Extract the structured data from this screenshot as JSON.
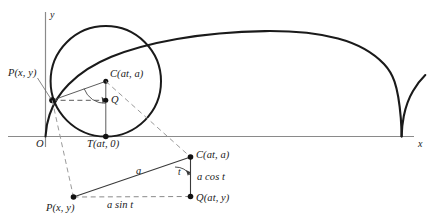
{
  "figure": {
    "axes": {
      "x_label": "x",
      "y_label": "y",
      "origin_label": "O"
    },
    "upper_diagram": {
      "point_P_label": "P(x, y)",
      "point_C_label": "C(at, a)",
      "point_Q_label": "Q",
      "point_T_label": "T(at, 0)"
    },
    "lower_diagram": {
      "point_C_label": "C(at, a)",
      "point_Q_label": "Q(at, y)",
      "point_P_label": "P(x, y)",
      "side_hypotenuse_label": "a",
      "side_vertical_label": "a cos t",
      "side_horizontal_label": "a sin t",
      "angle_label": "t"
    },
    "colors": {
      "curve": "#1a1a1a",
      "axis": "#8a8a8a",
      "dashed": "#9a9a9a",
      "solid_construction": "#4a4a4a",
      "background": "#ffffff"
    }
  }
}
